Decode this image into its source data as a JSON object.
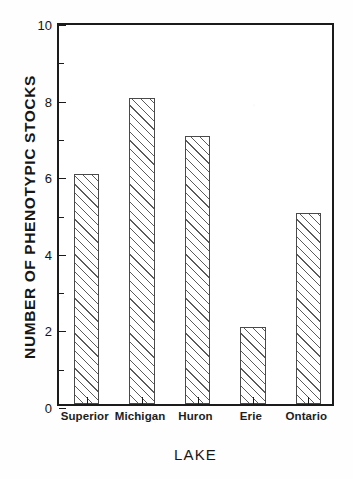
{
  "chart_data": {
    "type": "bar",
    "title": "",
    "categories": [
      "Superior",
      "Michigan",
      "Huron",
      "Erie",
      "Ontario"
    ],
    "values": [
      6,
      8,
      7,
      2,
      5
    ],
    "xlabel": "LAKE",
    "ylabel": "NUMBER  OF  PHENOTYPIC  STOCKS",
    "ylim": [
      0,
      10
    ],
    "yticks": [
      0,
      2,
      4,
      6,
      8,
      10
    ],
    "ytick_labels": [
      "0",
      "2",
      "4",
      "6",
      "8",
      "10"
    ],
    "minor_yticks": [
      1,
      3,
      5,
      7,
      9
    ],
    "grid": false,
    "legend": null,
    "bar_style": {
      "fill": "hatched-diagonal",
      "face_color": "#ffffff",
      "edge_color": "#4a4a4a",
      "hatch_color": "#5b5b5b"
    },
    "frame_color": "#1b1b1b",
    "background_color": "#ffffff"
  },
  "axis": {
    "y_title": "NUMBER  OF  PHENOTYPIC  STOCKS",
    "x_title": "LAKE"
  }
}
